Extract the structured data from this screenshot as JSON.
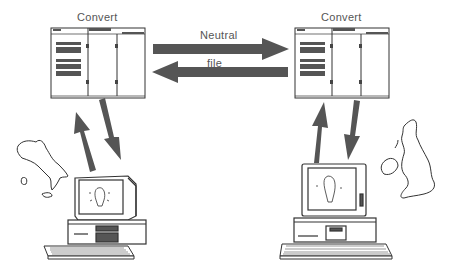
{
  "diagram": {
    "left_station": {
      "title": "Convert",
      "region": "Italy"
    },
    "right_station": {
      "title": "Convert",
      "region": "United Kingdom"
    },
    "link": {
      "label_top": "Neutral",
      "label_bottom": "file"
    },
    "colors": {
      "arrow": "#555555",
      "line": "#333333",
      "panel_bar": "#555555",
      "background": "#ffffff"
    }
  }
}
